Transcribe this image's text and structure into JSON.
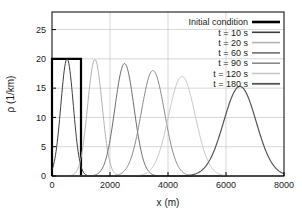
{
  "chart_data": {
    "type": "line",
    "title": "",
    "xlabel": "x (m)",
    "ylabel": "ρ (1/km)",
    "xlim": [
      0,
      8000
    ],
    "ylim": [
      0,
      28
    ],
    "xticks": [
      0,
      2000,
      4000,
      6000,
      8000
    ],
    "yticks": [
      0,
      5,
      10,
      15,
      20,
      25
    ],
    "xtick_labels": [
      "0",
      "2000",
      "4000",
      "6000",
      "8000"
    ],
    "ytick_labels": [
      "0",
      "5",
      "10",
      "15",
      "20",
      "25"
    ],
    "grid": true,
    "legend_position": "top-right",
    "series": [
      {
        "name": "Initial condition",
        "kind": "rect",
        "color": "#000000",
        "width": 2.2,
        "x_start": 0,
        "x_end": 1000,
        "height": 20
      },
      {
        "name": "t =   10 s",
        "kind": "gauss",
        "color": "#3d3d3d",
        "width": 1.0,
        "peak_x": 520,
        "peak_y": 20.0,
        "sigma": 215
      },
      {
        "name": "t =   20 s",
        "kind": "gauss",
        "color": "#b4b4b4",
        "width": 1.0,
        "peak_x": 1480,
        "peak_y": 19.9,
        "sigma": 250
      },
      {
        "name": "t =   60 s",
        "kind": "gauss",
        "color": "#6e6e6e",
        "width": 1.0,
        "peak_x": 2500,
        "peak_y": 19.2,
        "sigma": 330
      },
      {
        "name": "t =   90 s",
        "kind": "gauss",
        "color": "#8a8a8a",
        "width": 1.0,
        "peak_x": 3480,
        "peak_y": 18.0,
        "sigma": 400
      },
      {
        "name": "t = 120 s",
        "kind": "gauss",
        "color": "#c8c8c8",
        "width": 1.0,
        "peak_x": 4480,
        "peak_y": 17.0,
        "sigma": 460
      },
      {
        "name": "t = 180 s",
        "kind": "gauss",
        "color": "#555555",
        "width": 1.2,
        "peak_x": 6480,
        "peak_y": 15.3,
        "sigma": 560
      }
    ]
  },
  "axes": {
    "x_title": "x (m)",
    "y_title": "ρ (1/km)"
  },
  "legend": {
    "entries": [
      "Initial condition",
      "t =   10 s",
      "t =   20 s",
      "t =   60 s",
      "t =   90 s",
      "t = 120 s",
      "t = 180 s"
    ]
  },
  "colors": {
    "frame": "#000000",
    "grid": "#c4c4c4",
    "text": "#1a1a1a",
    "background": "#ffffff"
  }
}
